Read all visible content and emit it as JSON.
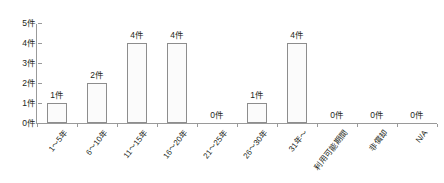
{
  "chart_data": {
    "type": "bar",
    "title": "",
    "subtitle": "",
    "xlabel": "",
    "ylabel": "",
    "grid": false,
    "legend": null,
    "ylim": [
      0,
      5
    ],
    "y_tick_labels": [
      "0件",
      "1件",
      "2件",
      "3件",
      "4件",
      "5件"
    ],
    "y_tick_values": [
      0,
      1,
      2,
      3,
      4,
      5
    ],
    "unit_suffix": "件",
    "categories": [
      "1～5年",
      "6～10年",
      "11～15年",
      "16～20年",
      "21～25年",
      "26～30年",
      "31年～",
      "利用可能期間",
      "非償却",
      "N/A"
    ],
    "values": [
      1,
      2,
      4,
      4,
      0,
      1,
      4,
      0,
      0,
      0
    ],
    "data_labels": [
      "1件",
      "2件",
      "4件",
      "4件",
      "0件",
      "1件",
      "4件",
      "0件",
      "0件",
      "0件"
    ],
    "colors": {
      "bar_fill": "#fbfbfb",
      "bar_border": "#8d8d8d",
      "axis": "#9a9a9a",
      "text": "#231f20",
      "background": "#ffffff"
    }
  }
}
